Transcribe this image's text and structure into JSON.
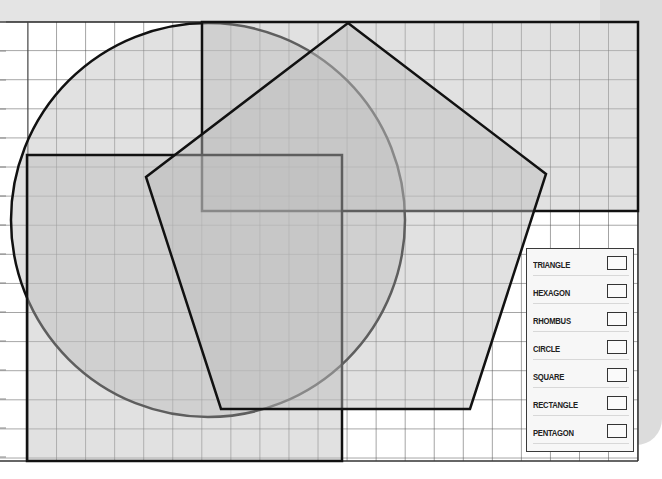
{
  "worksheet": {
    "title": "Shapes on grid paper",
    "grid": {
      "cell_size_px": 29,
      "line_color": "#555555",
      "origin_x": 28,
      "origin_y": 22
    },
    "colors": {
      "shape_fill": "#c8c8c8",
      "shape_stroke": "#111111",
      "paper_shadow": "#dcdcdc",
      "background": "#ffffff"
    },
    "shapes": [
      {
        "name": "circle",
        "cx": 208,
        "cy": 220,
        "r": 197
      },
      {
        "name": "rectangle",
        "x": 202,
        "y": 22,
        "width": 436,
        "height": 189
      },
      {
        "name": "square",
        "x": 27,
        "y": 155,
        "width": 315,
        "height": 306
      },
      {
        "name": "pentagon",
        "points": "348,23 546,174 470,409 221,409 146,177"
      }
    ]
  },
  "legend": {
    "items": [
      {
        "label": "TRIANGLE"
      },
      {
        "label": "HEXAGON"
      },
      {
        "label": "RHOMBUS"
      },
      {
        "label": "CIRCLE"
      },
      {
        "label": "SQUARE"
      },
      {
        "label": "RECTANGLE"
      },
      {
        "label": "PENTAGON"
      }
    ]
  }
}
